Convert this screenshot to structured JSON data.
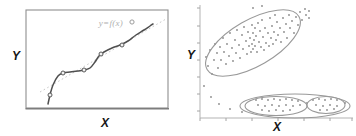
{
  "figure": {
    "left_panel": {
      "ylabel": "Y",
      "xlabel": "X",
      "annotation": "y=f(x)"
    },
    "right_panel": {
      "ylabel": "Y",
      "xlabel": "X"
    }
  },
  "colors": {
    "background": "#ffffff",
    "frame": "#8f8f8f",
    "frame_bottom": "#7d7d7d",
    "curve": "#4f4f4f",
    "trend": "#c8c8c8",
    "marker_stroke": "#5a5a5a",
    "marker_fill": "#f1f1f1",
    "annotation": "#b0b0b0",
    "axis": "#b3b3b3",
    "tick": "#a4a4a4",
    "dot": "#8a8a8a",
    "ellipse": "#999999",
    "outlier_stroke": "#9c9c9c"
  },
  "chart_data": [
    {
      "type": "line",
      "title": "",
      "xlabel": "X",
      "ylabel": "Y",
      "annotation": "y=f(x)",
      "axis_tick_labels_visible": false,
      "note": "axes unlabeled; coordinates are screenshot pixels",
      "frame": {
        "x": 26,
        "y": 10,
        "w": 142,
        "h": 98
      },
      "trend_line": {
        "x1": 40,
        "y1": 92,
        "x2": 166,
        "y2": 19
      },
      "curve": [
        [
          48,
          104
        ],
        [
          50,
          95
        ],
        [
          53,
          85
        ],
        [
          58,
          76
        ],
        [
          63,
          73
        ],
        [
          70,
          72
        ],
        [
          78,
          71
        ],
        [
          84,
          70
        ],
        [
          90,
          68
        ],
        [
          95,
          62
        ],
        [
          99,
          56
        ],
        [
          104,
          52
        ],
        [
          112,
          48
        ],
        [
          120,
          45
        ],
        [
          128,
          41
        ],
        [
          136,
          35
        ],
        [
          144,
          30
        ],
        [
          150,
          26
        ],
        [
          153,
          24
        ]
      ],
      "markers": [
        [
          50,
          95
        ],
        [
          63,
          73
        ],
        [
          84,
          70
        ],
        [
          101,
          54
        ],
        [
          122,
          45
        ]
      ],
      "outlier": [
        132,
        22
      ]
    },
    {
      "type": "scatter",
      "xlabel": "X",
      "ylabel": "Y",
      "axis_tick_labels_visible": false,
      "note": "axes unlabeled; coordinates are screenshot pixels",
      "y_axis": {
        "x": 200,
        "y1": 5,
        "y2": 118,
        "ticks_y": [
          8,
          26,
          43,
          60,
          77,
          94,
          111
        ]
      },
      "x_axis": {
        "y": 118,
        "x1": 200,
        "x2": 353,
        "ticks_x": [
          200,
          226,
          252,
          278,
          304,
          330,
          352
        ]
      },
      "ellipses": [
        {
          "name": "main-correlation-ellipse",
          "cx": 253,
          "cy": 43,
          "rx": 53,
          "ry": 23,
          "angle_deg": -30
        },
        {
          "name": "lower-outer-ellipse",
          "cx": 295,
          "cy": 106,
          "rx": 55,
          "ry": 12,
          "angle_deg": 0
        },
        {
          "name": "lower-left-subcluster-ellipse",
          "cx": 276,
          "cy": 106,
          "rx": 31,
          "ry": 9.5,
          "angle_deg": 0
        },
        {
          "name": "lower-right-subcluster-ellipse",
          "cx": 326,
          "cy": 105,
          "rx": 19,
          "ry": 8.5,
          "angle_deg": 0
        }
      ],
      "points": [
        [
          206,
          57
        ],
        [
          208,
          66
        ],
        [
          210,
          50
        ],
        [
          212,
          74
        ],
        [
          214,
          60
        ],
        [
          215,
          44
        ],
        [
          217,
          53
        ],
        [
          218,
          68
        ],
        [
          220,
          47
        ],
        [
          221,
          60
        ],
        [
          223,
          38
        ],
        [
          224,
          52
        ],
        [
          226,
          64
        ],
        [
          227,
          44
        ],
        [
          229,
          56
        ],
        [
          230,
          33
        ],
        [
          232,
          48
        ],
        [
          233,
          61
        ],
        [
          235,
          40
        ],
        [
          236,
          53
        ],
        [
          237,
          30
        ],
        [
          239,
          45
        ],
        [
          240,
          58
        ],
        [
          242,
          35
        ],
        [
          243,
          49
        ],
        [
          244,
          27
        ],
        [
          246,
          41
        ],
        [
          247,
          54
        ],
        [
          248,
          32
        ],
        [
          249,
          46
        ],
        [
          250,
          38
        ],
        [
          251,
          52
        ],
        [
          252,
          25
        ],
        [
          252,
          44
        ],
        [
          253,
          33
        ],
        [
          253,
          49
        ],
        [
          254,
          40
        ],
        [
          255,
          28
        ],
        [
          255,
          46
        ],
        [
          256,
          36
        ],
        [
          257,
          52
        ],
        [
          258,
          23
        ],
        [
          259,
          42
        ],
        [
          260,
          31
        ],
        [
          261,
          47
        ],
        [
          262,
          20
        ],
        [
          263,
          37
        ],
        [
          264,
          50
        ],
        [
          265,
          28
        ],
        [
          266,
          43
        ],
        [
          268,
          33
        ],
        [
          269,
          46
        ],
        [
          270,
          18
        ],
        [
          271,
          38
        ],
        [
          272,
          26
        ],
        [
          273,
          44
        ],
        [
          274,
          32
        ],
        [
          275,
          15
        ],
        [
          276,
          40
        ],
        [
          277,
          22
        ],
        [
          278,
          35
        ],
        [
          280,
          28
        ],
        [
          281,
          42
        ],
        [
          283,
          18
        ],
        [
          284,
          32
        ],
        [
          286,
          24
        ],
        [
          287,
          38
        ],
        [
          289,
          15
        ],
        [
          290,
          28
        ],
        [
          292,
          21
        ],
        [
          294,
          33
        ],
        [
          296,
          17
        ],
        [
          298,
          25
        ],
        [
          300,
          12
        ],
        [
          302,
          20
        ],
        [
          305,
          9
        ],
        [
          306,
          15
        ],
        [
          309,
          11
        ],
        [
          309,
          18
        ],
        [
          253,
          8
        ],
        [
          262,
          6
        ],
        [
          204,
          86
        ],
        [
          211,
          97
        ],
        [
          219,
          104
        ],
        [
          230,
          109
        ],
        [
          242,
          112
        ],
        [
          256,
          100
        ],
        [
          262,
          99
        ],
        [
          268,
          100
        ],
        [
          274,
          99
        ],
        [
          280,
          100
        ],
        [
          286,
          99
        ],
        [
          292,
          100
        ],
        [
          298,
          101
        ],
        [
          258,
          105
        ],
        [
          265,
          106
        ],
        [
          272,
          105
        ],
        [
          279,
          106
        ],
        [
          286,
          105
        ],
        [
          293,
          106
        ],
        [
          300,
          105
        ],
        [
          262,
          110
        ],
        [
          269,
          111
        ],
        [
          276,
          110
        ],
        [
          283,
          111
        ],
        [
          290,
          110
        ],
        [
          313,
          100
        ],
        [
          319,
          99
        ],
        [
          325,
          100
        ],
        [
          331,
          99
        ],
        [
          337,
          100
        ],
        [
          316,
          105
        ],
        [
          323,
          106
        ],
        [
          330,
          105
        ],
        [
          337,
          106
        ],
        [
          320,
          110
        ],
        [
          327,
          110
        ],
        [
          334,
          109
        ],
        [
          307,
          103
        ],
        [
          345,
          103
        ]
      ]
    }
  ]
}
